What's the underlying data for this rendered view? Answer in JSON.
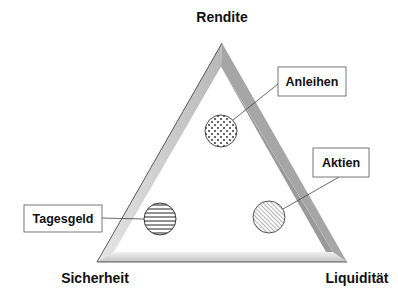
{
  "diagram": {
    "type": "magic-triangle",
    "vertices": {
      "top": "Rendite",
      "bottom_left": "Sicherheit",
      "bottom_right": "Liquidität"
    },
    "items": [
      {
        "label": "Anleihen",
        "pattern": "dots"
      },
      {
        "label": "Aktien",
        "pattern": "diagonal-hatch"
      },
      {
        "label": "Tagesgeld",
        "pattern": "horizontal-stripes"
      }
    ],
    "colors": {
      "outline": "#333333",
      "bevel_left": "#c8c8c8",
      "bevel_bottom": "#dcdcdc",
      "bevel_right": "#9a9a9a",
      "text": "#111111"
    }
  }
}
